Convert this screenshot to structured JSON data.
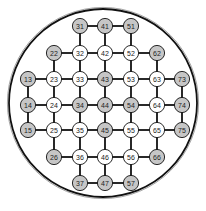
{
  "diagram": {
    "type": "grid-graph-in-circle",
    "colors": {
      "background": "#ffffff",
      "edge": "#111111",
      "node_stroke": "#111111",
      "node_white": "#ffffff",
      "node_grey": "#c6c6c6",
      "circle_outer": "#9a9a9a",
      "circle_inner": "#111111"
    },
    "boundary_circle": {
      "cx": 103,
      "cy": 103,
      "r": 94
    },
    "columns_x": {
      "1": 28,
      "2": 54,
      "3": 80,
      "4": 105,
      "5": 131,
      "6": 157,
      "7": 182
    },
    "rows_y": {
      "1": 26,
      "2": 53,
      "3": 79,
      "4": 105,
      "5": 130,
      "6": 157,
      "7": 183
    },
    "nodes": [
      {
        "id": "31",
        "col": 3,
        "row": 1,
        "shade": "grey"
      },
      {
        "id": "41",
        "col": 4,
        "row": 1,
        "shade": "grey"
      },
      {
        "id": "51",
        "col": 5,
        "row": 1,
        "shade": "grey"
      },
      {
        "id": "22",
        "col": 2,
        "row": 2,
        "shade": "grey"
      },
      {
        "id": "32",
        "col": 3,
        "row": 2,
        "shade": "white"
      },
      {
        "id": "42",
        "col": 4,
        "row": 2,
        "shade": "white"
      },
      {
        "id": "52",
        "col": 5,
        "row": 2,
        "shade": "white"
      },
      {
        "id": "62",
        "col": 6,
        "row": 2,
        "shade": "grey"
      },
      {
        "id": "13",
        "col": 1,
        "row": 3,
        "shade": "grey"
      },
      {
        "id": "23",
        "col": 2,
        "row": 3,
        "shade": "white"
      },
      {
        "id": "33",
        "col": 3,
        "row": 3,
        "shade": "white"
      },
      {
        "id": "43",
        "col": 4,
        "row": 3,
        "shade": "grey"
      },
      {
        "id": "53",
        "col": 5,
        "row": 3,
        "shade": "white"
      },
      {
        "id": "63",
        "col": 6,
        "row": 3,
        "shade": "white"
      },
      {
        "id": "73",
        "col": 7,
        "row": 3,
        "shade": "grey"
      },
      {
        "id": "14",
        "col": 1,
        "row": 4,
        "shade": "grey"
      },
      {
        "id": "24",
        "col": 2,
        "row": 4,
        "shade": "white"
      },
      {
        "id": "34",
        "col": 3,
        "row": 4,
        "shade": "grey"
      },
      {
        "id": "44",
        "col": 4,
        "row": 4,
        "shade": "grey"
      },
      {
        "id": "54",
        "col": 5,
        "row": 4,
        "shade": "grey"
      },
      {
        "id": "64",
        "col": 6,
        "row": 4,
        "shade": "white"
      },
      {
        "id": "74",
        "col": 7,
        "row": 4,
        "shade": "grey"
      },
      {
        "id": "15",
        "col": 1,
        "row": 5,
        "shade": "grey"
      },
      {
        "id": "25",
        "col": 2,
        "row": 5,
        "shade": "white"
      },
      {
        "id": "35",
        "col": 3,
        "row": 5,
        "shade": "white"
      },
      {
        "id": "45",
        "col": 4,
        "row": 5,
        "shade": "grey"
      },
      {
        "id": "55",
        "col": 5,
        "row": 5,
        "shade": "white"
      },
      {
        "id": "65",
        "col": 6,
        "row": 5,
        "shade": "white"
      },
      {
        "id": "75",
        "col": 7,
        "row": 5,
        "shade": "grey"
      },
      {
        "id": "26",
        "col": 2,
        "row": 6,
        "shade": "grey"
      },
      {
        "id": "36",
        "col": 3,
        "row": 6,
        "shade": "white"
      },
      {
        "id": "46",
        "col": 4,
        "row": 6,
        "shade": "white"
      },
      {
        "id": "56",
        "col": 5,
        "row": 6,
        "shade": "white"
      },
      {
        "id": "66",
        "col": 6,
        "row": 6,
        "shade": "grey"
      },
      {
        "id": "37",
        "col": 3,
        "row": 7,
        "shade": "grey"
      },
      {
        "id": "47",
        "col": 4,
        "row": 7,
        "shade": "grey"
      },
      {
        "id": "57",
        "col": 5,
        "row": 7,
        "shade": "grey"
      }
    ],
    "edges": [
      [
        "31",
        "41"
      ],
      [
        "41",
        "51"
      ],
      [
        "22",
        "32"
      ],
      [
        "32",
        "42"
      ],
      [
        "42",
        "52"
      ],
      [
        "52",
        "62"
      ],
      [
        "13",
        "23"
      ],
      [
        "23",
        "33"
      ],
      [
        "33",
        "43"
      ],
      [
        "43",
        "53"
      ],
      [
        "53",
        "63"
      ],
      [
        "63",
        "73"
      ],
      [
        "14",
        "24"
      ],
      [
        "24",
        "34"
      ],
      [
        "34",
        "44"
      ],
      [
        "44",
        "54"
      ],
      [
        "54",
        "64"
      ],
      [
        "64",
        "74"
      ],
      [
        "15",
        "25"
      ],
      [
        "25",
        "35"
      ],
      [
        "35",
        "45"
      ],
      [
        "45",
        "55"
      ],
      [
        "55",
        "65"
      ],
      [
        "65",
        "75"
      ],
      [
        "26",
        "36"
      ],
      [
        "36",
        "46"
      ],
      [
        "46",
        "56"
      ],
      [
        "56",
        "66"
      ],
      [
        "37",
        "47"
      ],
      [
        "47",
        "57"
      ],
      [
        "31",
        "32"
      ],
      [
        "41",
        "42"
      ],
      [
        "51",
        "52"
      ],
      [
        "22",
        "23"
      ],
      [
        "32",
        "33"
      ],
      [
        "42",
        "43"
      ],
      [
        "52",
        "53"
      ],
      [
        "62",
        "63"
      ],
      [
        "13",
        "14"
      ],
      [
        "23",
        "24"
      ],
      [
        "33",
        "34"
      ],
      [
        "43",
        "44"
      ],
      [
        "53",
        "54"
      ],
      [
        "63",
        "64"
      ],
      [
        "73",
        "74"
      ],
      [
        "14",
        "15"
      ],
      [
        "24",
        "25"
      ],
      [
        "34",
        "35"
      ],
      [
        "44",
        "45"
      ],
      [
        "54",
        "55"
      ],
      [
        "64",
        "65"
      ],
      [
        "74",
        "75"
      ],
      [
        "25",
        "26"
      ],
      [
        "35",
        "36"
      ],
      [
        "45",
        "46"
      ],
      [
        "55",
        "56"
      ],
      [
        "65",
        "66"
      ],
      [
        "36",
        "37"
      ],
      [
        "46",
        "47"
      ],
      [
        "56",
        "57"
      ]
    ]
  }
}
